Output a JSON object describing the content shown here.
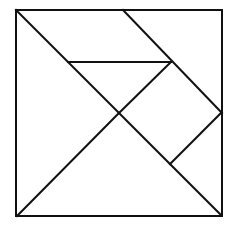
{
  "diagram": {
    "type": "tangram",
    "stroke_color": "#111111",
    "background": "#ffffff",
    "stroke_width": 2,
    "outer_square": {
      "x1": 16,
      "y1": 10,
      "x2": 222,
      "y2": 216
    },
    "segments": [
      {
        "name": "main-diagonal",
        "x1": 16,
        "y1": 10,
        "x2": 221,
        "y2": 215
      },
      {
        "name": "anti-diagonal-lower",
        "x1": 17,
        "y1": 216,
        "x2": 119,
        "y2": 113
      },
      {
        "name": "anti-diagonal-upper",
        "x1": 119,
        "y1": 113,
        "x2": 171,
        "y2": 62
      },
      {
        "name": "top-slant",
        "x1": 123,
        "y1": 10,
        "x2": 222,
        "y2": 113
      },
      {
        "name": "mid-horizontal",
        "x1": 68,
        "y1": 62,
        "x2": 171,
        "y2": 62
      },
      {
        "name": "square-lower-edge",
        "x1": 221,
        "y1": 113,
        "x2": 170,
        "y2": 164
      }
    ],
    "pieces": [
      {
        "name": "large-triangle-left",
        "points": "16,10 17,216 119,113"
      },
      {
        "name": "large-triangle-bottom",
        "points": "17,216 221,215 119,113"
      },
      {
        "name": "parallelogram-top",
        "points": "16,10 123,10 171,62 68,62"
      },
      {
        "name": "medium-triangle-top-right",
        "points": "123,10 222,10 222,113"
      },
      {
        "name": "small-triangle-middle",
        "points": "68,62 171,62 119,113"
      },
      {
        "name": "square-right",
        "points": "171,62 221,113 170,164 119,113"
      },
      {
        "name": "small-triangle-right",
        "points": "221,113 221,215 170,164"
      }
    ]
  }
}
